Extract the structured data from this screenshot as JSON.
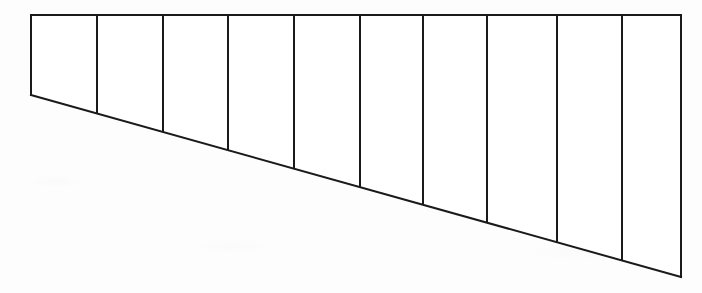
{
  "figure": {
    "background_color": "#fdfdfd",
    "stroke_color": "#1a1a1a",
    "stroke_width": 2,
    "canvas": {
      "width": 702,
      "height": 293
    }
  },
  "chart_data": {
    "type": "line",
    "subtitle": "",
    "xlabel": "",
    "ylabel": "",
    "xlim": [
      0,
      702
    ],
    "ylim": [
      0,
      293
    ],
    "grid": false,
    "legend_position": "none",
    "annotations": [],
    "tick_labels": {
      "x": [],
      "y": []
    },
    "outline": {
      "name": "wedge-outline",
      "closed": true,
      "points": [
        {
          "x": 31,
          "y": 15
        },
        {
          "x": 681,
          "y": 15
        },
        {
          "x": 681,
          "y": 277
        },
        {
          "x": 31,
          "y": 95
        }
      ]
    },
    "edges": [
      {
        "name": "top-edge",
        "x1": 31,
        "y1": 15,
        "x2": 681,
        "y2": 15
      },
      {
        "name": "right-edge",
        "x1": 681,
        "y1": 15,
        "x2": 681,
        "y2": 277
      },
      {
        "name": "bottom-edge",
        "x1": 31,
        "y1": 95,
        "x2": 681,
        "y2": 277
      },
      {
        "name": "left-edge",
        "x1": 31,
        "y1": 15,
        "x2": 31,
        "y2": 95
      }
    ],
    "series": [
      {
        "name": "panel-dividers",
        "kind": "vertical-lines",
        "count": 9,
        "values": [
          {
            "index": 1,
            "x": 97,
            "y_top": 15,
            "y_bottom": 113
          },
          {
            "index": 2,
            "x": 163,
            "y_top": 15,
            "y_bottom": 132
          },
          {
            "index": 3,
            "x": 228,
            "y_top": 15,
            "y_bottom": 150
          },
          {
            "index": 4,
            "x": 294,
            "y_top": 15,
            "y_bottom": 169
          },
          {
            "index": 5,
            "x": 360,
            "y_top": 15,
            "y_bottom": 187
          },
          {
            "index": 6,
            "x": 423,
            "y_top": 15,
            "y_bottom": 205
          },
          {
            "index": 7,
            "x": 487,
            "y_top": 15,
            "y_bottom": 223
          },
          {
            "index": 8,
            "x": 557,
            "y_top": 15,
            "y_bottom": 242
          },
          {
            "index": 9,
            "x": 622,
            "y_top": 15,
            "y_bottom": 261
          }
        ]
      },
      {
        "name": "panel-depths",
        "kind": "bar",
        "categories": [
          "1",
          "2",
          "3",
          "4",
          "5",
          "6",
          "7",
          "8",
          "9",
          "10"
        ],
        "values": [
          80,
          98,
          117,
          135,
          154,
          172,
          190,
          208,
          227,
          246
        ]
      }
    ]
  }
}
